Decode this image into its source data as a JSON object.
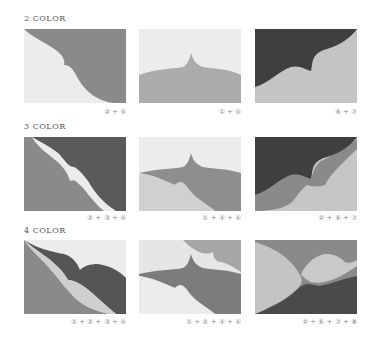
{
  "colors": {
    "c1": "#ededed",
    "c2": "#d6d6d6",
    "c3": "#e4e4e4",
    "c4": "#8c8c8c",
    "c5": "#a3a3a3",
    "c6": "#4a4a4a",
    "c7": "#bdbdbd",
    "c8": "#3e3e3e",
    "mid": "#7a7a7a",
    "light": "#c9c9c9"
  },
  "sections": [
    {
      "title": "2 COLOR",
      "panels": [
        {
          "caption": "② + ④"
        },
        {
          "caption": "① + ⑤"
        },
        {
          "caption": "⑥ + ⑦"
        }
      ]
    },
    {
      "title": "3 COLOR",
      "panels": [
        {
          "caption": "② + ③ + ④"
        },
        {
          "caption": "① + ④ + ⑤"
        },
        {
          "caption": "② + ⑥ + ⑦"
        }
      ]
    },
    {
      "title": "4 COLOR",
      "panels": [
        {
          "caption": "① + ② + ③ + ④"
        },
        {
          "caption": "① + ② + ④ + ⑤"
        },
        {
          "caption": "② + ⑥ + ⑦ + ⑧"
        }
      ]
    }
  ]
}
